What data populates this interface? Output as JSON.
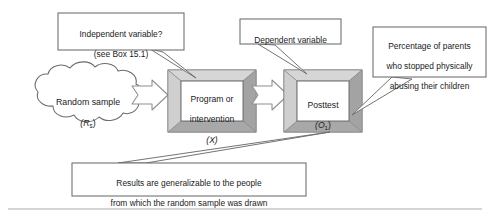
{
  "diagram": {
    "type": "flow-diagram",
    "background_color": "#ffffff",
    "colors": {
      "box_fill": "#ffffff",
      "box_bevel_light": "#c8c8c8",
      "box_bevel_dark": "#9a9a9a",
      "box_outline": "#6e6e6e",
      "arrow_fill": "#ffffff",
      "arrow_outline": "#8a8a8a",
      "callout_outline": "#6b6b6b",
      "cloud_outline": "#6b6b6b",
      "text": "#1a1a1a",
      "bottom_rule": "#c9c9c9"
    },
    "nodes": [
      {
        "id": "random-sample",
        "shape": "cloud",
        "line1": "Random sample",
        "line2_prefix": "(R",
        "line2_sub": "s",
        "line2_suffix": ")"
      },
      {
        "id": "program-intervention",
        "shape": "beveled-box",
        "line1": "Program or",
        "line2": "intervention",
        "line3": "(X)",
        "symbol": "X"
      },
      {
        "id": "posttest",
        "shape": "beveled-box",
        "line1": "Posttest",
        "line2_prefix": "(O",
        "line2_sub": "1",
        "line2_suffix": ")",
        "symbol": "O1"
      }
    ],
    "connectors": [
      {
        "id": "arrow-sample-to-program",
        "shape": "block-arrow",
        "from": "random-sample",
        "to": "program-intervention"
      },
      {
        "id": "arrow-program-to-posttest",
        "shape": "block-arrow",
        "from": "program-intervention",
        "to": "posttest"
      }
    ],
    "callouts": [
      {
        "id": "independent-variable",
        "line1": "Independent variable?",
        "line2": "(see Box 15.1)",
        "points_to": "program-intervention"
      },
      {
        "id": "dependent-variable",
        "line1": "Dependent variable",
        "points_to": "posttest"
      },
      {
        "id": "outcome-measure",
        "line1": "Percentage of parents",
        "line2": "who stopped physically",
        "line3": "abusing their children",
        "points_to": "posttest"
      },
      {
        "id": "generalizability",
        "line1": "Results are generalizable to the people",
        "line2": "from which the random sample was drawn",
        "points_to": "posttest"
      }
    ]
  }
}
